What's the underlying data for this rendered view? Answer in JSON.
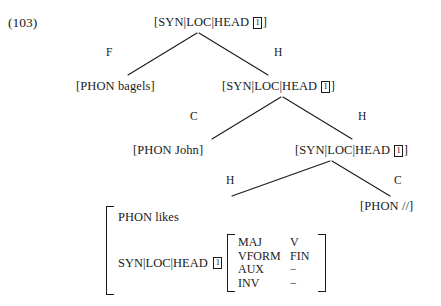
{
  "figure": {
    "example_number": "(103)",
    "ink_color": "#1a1a1a",
    "background_color": "#ffffff"
  },
  "tree": {
    "nodes": {
      "root": {
        "text_prefix": "[SYN|LOC|HEAD ",
        "tag": "1",
        "text_suffix": "]"
      },
      "filler_leaf": {
        "text": "[PHON bagels]"
      },
      "s_node": {
        "text_prefix": "[SYN|LOC|HEAD ",
        "tag": "1",
        "text_suffix": "]"
      },
      "subject_leaf": {
        "text": "[PHON John]"
      },
      "vp_node": {
        "text_prefix": "[SYN|LOC|HEAD ",
        "tag": "1",
        "text_suffix": "]"
      },
      "trace_leaf": {
        "text": "[PHON //]"
      }
    },
    "branch_labels": {
      "root_left": "F",
      "root_right": "H",
      "s_left": "C",
      "s_right": "H",
      "vp_left": "H",
      "vp_right": "C"
    }
  },
  "avm": {
    "phon": {
      "attribute": "PHON",
      "value": "likes"
    },
    "head": {
      "path": "SYN|LOC|HEAD",
      "tag": "1"
    },
    "inner_rows": [
      {
        "attribute": "MAJ",
        "value": "V"
      },
      {
        "attribute": "VFORM",
        "value": "FIN"
      },
      {
        "attribute": "AUX",
        "value": "−"
      },
      {
        "attribute": "INV",
        "value": "−"
      }
    ]
  }
}
